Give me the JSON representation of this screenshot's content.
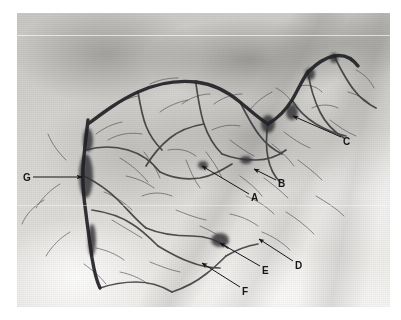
{
  "figure": {
    "type": "angiogram",
    "modality": "digital subtraction angiography",
    "alt": "Grayscale angiogram of a vascular network with seven lettered annotation arrows",
    "width": 401,
    "height": 320,
    "background_color": "#ffffff",
    "film": {
      "x": 17,
      "y": 13,
      "width": 373,
      "height": 294,
      "base_color": "#d8d7d3"
    },
    "ink_color": "#16161a",
    "vessel_color": "#2b2b2e"
  },
  "annotations": [
    {
      "id": "A",
      "label": "A",
      "label_x": 251,
      "label_y": 193,
      "line": {
        "x1": 249,
        "y1": 194,
        "x2": 202,
        "y2": 166
      },
      "arrow_at": "tail"
    },
    {
      "id": "B",
      "label": "B",
      "label_x": 278,
      "label_y": 179,
      "line": {
        "x1": 276,
        "y1": 180,
        "x2": 254,
        "y2": 169
      },
      "arrow_at": "tail"
    },
    {
      "id": "C",
      "label": "C",
      "label_x": 343,
      "label_y": 137,
      "line": {
        "x1": 341,
        "y1": 137,
        "x2": 293,
        "y2": 116
      },
      "arrow_at": "tail"
    },
    {
      "id": "D",
      "label": "D",
      "label_x": 295,
      "label_y": 261,
      "line": {
        "x1": 293,
        "y1": 261,
        "x2": 259,
        "y2": 239
      },
      "arrow_at": "tail"
    },
    {
      "id": "E",
      "label": "E",
      "label_x": 262,
      "label_y": 266,
      "line": {
        "x1": 260,
        "y1": 266,
        "x2": 220,
        "y2": 243
      },
      "arrow_at": "tail"
    },
    {
      "id": "F",
      "label": "F",
      "label_x": 242,
      "label_y": 287,
      "line": {
        "x1": 240,
        "y1": 287,
        "x2": 202,
        "y2": 263
      },
      "arrow_at": "tail"
    },
    {
      "id": "G",
      "label": "G",
      "label_x": 23,
      "label_y": 173,
      "line": {
        "x1": 33,
        "y1": 177,
        "x2": 82,
        "y2": 177
      },
      "arrow_at": "head"
    }
  ],
  "seams": [
    {
      "top": 22,
      "opacity": 0.8
    },
    {
      "top": 192,
      "opacity": 0.55
    }
  ],
  "vessels": {
    "trunks": [
      "M88,120 C86,138 84,152 83,168 C82,186 84,200 86,214 C88,230 90,244 92,258 C94,270 96,280 100,288",
      "M88,124 C104,112 120,100 138,92 C158,83 178,80 196,82",
      "M196,82 C214,84 228,92 240,102 C250,110 258,118 268,124",
      "M268,124 C278,118 286,110 292,100 C298,90 302,80 308,72",
      "M308,72 C316,64 324,58 334,56 C344,54 352,58 358,66"
    ],
    "branches": [
      "M86,150 C100,146 114,146 128,150 C142,154 152,162 160,172",
      "M160,172 C172,178 186,180 200,178 C212,176 222,170 232,164",
      "M84,176 C96,182 108,190 118,200 C128,210 136,220 146,228",
      "M146,228 C160,234 176,236 192,236 C206,236 218,240 228,248",
      "M92,210 C106,212 120,216 132,224 C142,230 150,238 158,246",
      "M196,84 C198,98 200,112 204,124 C208,136 214,146 222,154",
      "M222,154 C232,158 244,160 256,160 C268,160 278,156 286,150",
      "M240,102 C246,114 252,126 260,136 C266,144 274,150 282,154",
      "M292,100 C298,110 306,118 316,124 C326,130 336,134 346,136",
      "M308,72 C310,86 314,100 320,112 C326,124 334,132 344,138",
      "M334,56 C340,68 346,80 354,90 C360,98 368,104 376,108",
      "M268,124 C266,136 266,148 268,158 C270,168 274,176 280,182",
      "M204,124 C192,126 180,130 170,138 C160,146 152,156 146,166",
      "M138,92 C140,104 142,116 146,126 C150,136 156,144 162,150",
      "M100,288 C112,284 124,282 136,282 C150,282 162,286 172,292",
      "M172,292 C184,288 196,282 206,274 C214,268 220,262 226,256",
      "M226,256 C236,250 246,246 258,244",
      "M158,246 C168,252 178,258 190,262 C200,266 210,268 220,268"
    ],
    "fine": [
      "M108,140 C118,134 130,132 142,134",
      "M120,158 C130,164 140,172 148,182",
      "M168,150 C178,148 188,150 196,156",
      "M186,160 C190,170 194,180 200,188",
      "M212,130 C220,126 230,124 240,126",
      "M230,140 C238,146 246,152 254,156",
      "M250,110 C256,102 264,96 272,92",
      "M276,88 C284,92 290,98 294,106",
      "M300,86 C308,84 316,86 322,92",
      "M312,108 C320,104 330,104 338,108",
      "M330,120 C338,126 346,132 356,136",
      "M348,92 C356,94 364,98 370,104",
      "M356,70 C364,74 370,80 374,88",
      "M104,192 C114,196 124,202 132,210",
      "M112,220 C122,226 132,232 142,238",
      "M142,196 C152,192 162,192 172,196",
      "M176,210 C186,214 196,218 206,220",
      "M200,226 C210,230 220,236 228,242",
      "M230,214 C240,216 250,220 258,226",
      "M246,196 C256,200 266,206 274,214",
      "M264,178 C272,184 280,190 288,198",
      "M150,262 C160,266 170,270 180,272",
      "M60,184 C50,190 42,198 36,208",
      "M44,200 C34,206 26,214 22,224",
      "M66,160 C58,152 52,144 48,134",
      "M70,232 C60,238 52,246 46,256",
      "M96,248 C106,250 116,254 124,260",
      "M214,104 C222,98 232,94 242,94",
      "M182,104 C190,98 200,94 210,94",
      "M160,112 C168,106 178,102 188,100",
      "M284,132 C292,138 300,144 310,148",
      "M272,144 C280,150 288,158 294,166",
      "M298,160 C306,166 314,172 322,180",
      "M316,196 C326,202 336,208 344,216",
      "M286,212 C296,218 306,226 314,234",
      "M262,232 C272,236 282,242 290,250",
      "M240,176 C248,182 256,188 262,196",
      "M206,152 C212,160 218,168 222,178",
      "M126,176 C136,178 146,182 154,188",
      "M144,152 C150,160 156,168 160,178",
      "M96,134 C104,128 112,124 122,122",
      "M110,108 C118,102 128,98 138,96",
      "M150,84 C158,80 168,78 178,78",
      "M84,264 C92,270 100,276 106,284",
      "M120,272 C130,274 140,278 148,284"
    ],
    "hotspots": [
      {
        "cx": 86,
        "cy": 176,
        "rx": 7,
        "ry": 22
      },
      {
        "cx": 88,
        "cy": 140,
        "rx": 5,
        "ry": 12
      },
      {
        "cx": 92,
        "cy": 240,
        "rx": 4,
        "ry": 16
      },
      {
        "cx": 220,
        "cy": 240,
        "rx": 9,
        "ry": 7
      },
      {
        "cx": 268,
        "cy": 124,
        "rx": 7,
        "ry": 9
      },
      {
        "cx": 292,
        "cy": 112,
        "rx": 6,
        "ry": 8
      },
      {
        "cx": 310,
        "cy": 74,
        "rx": 5,
        "ry": 6
      },
      {
        "cx": 246,
        "cy": 160,
        "rx": 6,
        "ry": 4
      },
      {
        "cx": 203,
        "cy": 165,
        "rx": 5,
        "ry": 4
      },
      {
        "cx": 334,
        "cy": 58,
        "rx": 4,
        "ry": 5
      }
    ]
  }
}
